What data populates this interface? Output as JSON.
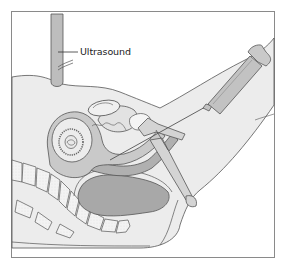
{
  "figure": {
    "labels": [
      {
        "id": "ultrasound",
        "text": "Ultrasound",
        "x": 80,
        "y": 46
      }
    ],
    "colors": {
      "frame": "#8a8a8a",
      "skin_fill": "#ececec",
      "outline": "#555555",
      "organ_fill": "#c9c9c9",
      "dark_organ_fill": "#a8a8a8",
      "bone_fill": "#f4f4f4",
      "probe_fill": "#bdbdbd",
      "syringe_fill": "#c2c2c2",
      "background": "#ffffff"
    }
  }
}
